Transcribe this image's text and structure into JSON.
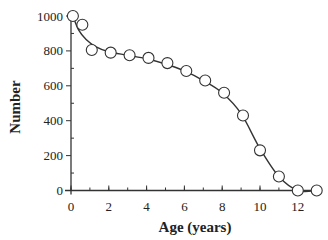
{
  "chart_data": {
    "type": "scatter",
    "title": "",
    "xlabel": "Age (years)",
    "ylabel": "Number",
    "xlim": [
      0,
      13
    ],
    "ylim": [
      0,
      1000
    ],
    "grid": false,
    "legend": null,
    "x_ticks": [
      0,
      2,
      4,
      6,
      8,
      10,
      12
    ],
    "x_tick_labels": [
      "0",
      "2",
      "4",
      "6",
      "8",
      "10",
      "12"
    ],
    "y_ticks": [
      0,
      200,
      400,
      600,
      800,
      1000
    ],
    "y_tick_labels": [
      "0",
      "200",
      "400",
      "600",
      "800",
      "1000"
    ],
    "series": [
      {
        "name": "Observed",
        "marker": "open-circle",
        "x": [
          0.1,
          0.6,
          1.1,
          2.1,
          3.1,
          4.1,
          5.1,
          6.1,
          7.1,
          8.1,
          9.1,
          10.0,
          11.0,
          12.0,
          13.0
        ],
        "y": [
          1000,
          950,
          805,
          790,
          775,
          760,
          730,
          685,
          630,
          560,
          430,
          230,
          80,
          0,
          0
        ]
      },
      {
        "name": "Fitted curve",
        "style": "line",
        "x": [
          0.1,
          0.4,
          0.8,
          1.3,
          2.0,
          3.0,
          4.0,
          5.0,
          6.0,
          7.0,
          8.0,
          9.0,
          10.0,
          11.0,
          12.0,
          13.0
        ],
        "y": [
          1000,
          920,
          865,
          825,
          795,
          775,
          755,
          725,
          685,
          630,
          560,
          440,
          240,
          80,
          0,
          0
        ]
      }
    ]
  },
  "axes": {
    "x_title": "Age (years)",
    "y_title": "Number"
  },
  "colors": {
    "line": "#333333",
    "marker_fill": "#ffffff",
    "marker_stroke": "#333333",
    "text": "#222222"
  }
}
